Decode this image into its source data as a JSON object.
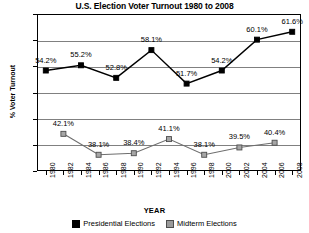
{
  "chart_data": {
    "type": "line",
    "title": "U.S. Election Voter Turnout 1980 to 2008",
    "xlabel": "YEAR",
    "ylabel": "% Voter Turnout",
    "ylim": [
      35,
      65
    ],
    "ytick_labels": [
      "65%",
      "60%",
      "55%",
      "50%",
      "45%",
      "40%",
      "35%"
    ],
    "ytick_values": [
      65,
      60,
      55,
      50,
      45,
      40,
      35
    ],
    "grid": "horizontal",
    "legend_position": "bottom",
    "categories": [
      "1980",
      "1982",
      "1984",
      "1986",
      "1988",
      "1990",
      "1992",
      "1994",
      "1996",
      "1998",
      "2000",
      "2002",
      "2004",
      "2006",
      "2008"
    ],
    "series": [
      {
        "name": "Presidential Elections",
        "color": "#000000",
        "marker": "square",
        "points": [
          {
            "x": "1980",
            "y": 54.2,
            "label": "54.2%"
          },
          {
            "x": "1984",
            "y": 55.2,
            "label": "55.2%"
          },
          {
            "x": "1988",
            "y": 52.8,
            "label": "52.8%"
          },
          {
            "x": "1992",
            "y": 58.1,
            "label": "58.1%"
          },
          {
            "x": "1996",
            "y": 51.7,
            "label": "51.7%"
          },
          {
            "x": "2000",
            "y": 54.2,
            "label": "54.2%"
          },
          {
            "x": "2004",
            "y": 60.1,
            "label": "60.1%"
          },
          {
            "x": "2008",
            "y": 61.6,
            "label": "61.6%"
          }
        ]
      },
      {
        "name": "Midterm Elections",
        "color": "#9a9a9a",
        "marker": "square",
        "points": [
          {
            "x": "1982",
            "y": 42.1,
            "label": "42.1%"
          },
          {
            "x": "1986",
            "y": 38.1,
            "label": "38.1%"
          },
          {
            "x": "1990",
            "y": 38.4,
            "label": "38.4%"
          },
          {
            "x": "1994",
            "y": 41.1,
            "label": "41.1%"
          },
          {
            "x": "1998",
            "y": 38.1,
            "label": "38.1%"
          },
          {
            "x": "2002",
            "y": 39.5,
            "label": "39.5%"
          },
          {
            "x": "2006",
            "y": 40.4,
            "label": "40.4%"
          }
        ]
      }
    ]
  },
  "legend": {
    "entries": [
      {
        "label": "Presidential Elections",
        "color": "#000000"
      },
      {
        "label": "Midterm Elections",
        "color": "#9a9a9a"
      }
    ]
  }
}
